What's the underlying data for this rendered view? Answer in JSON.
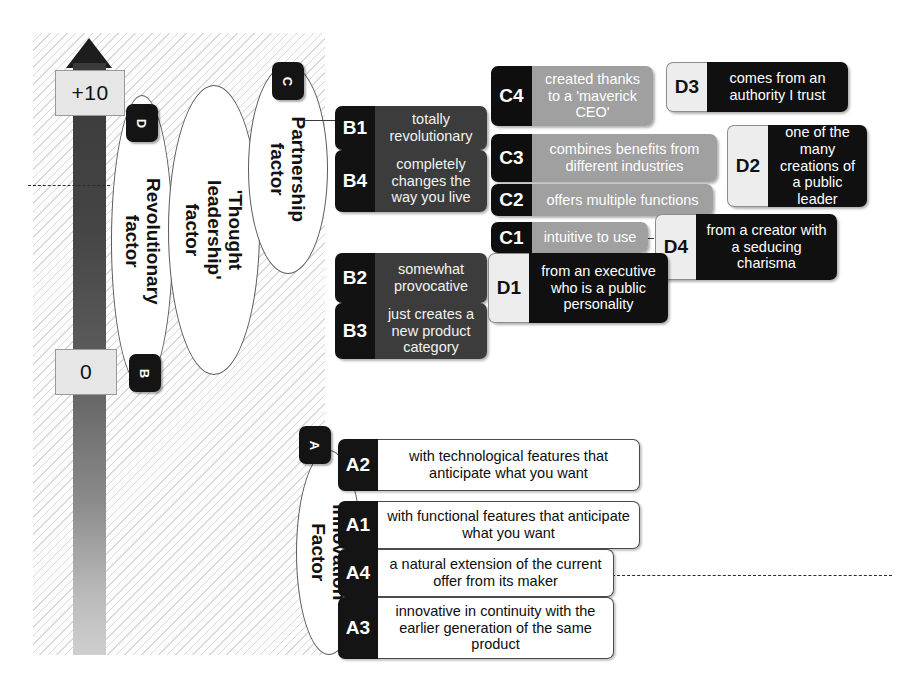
{
  "diagram": {
    "scale": {
      "top_label": "+10",
      "bottom_label": "0",
      "arrow": "up-arrow"
    },
    "ellipses": [
      {
        "id": "revolutionary",
        "label": "Revolutionary\nfactor",
        "line1": "Revolutionary",
        "line2": "factor"
      },
      {
        "id": "thought-leadership",
        "label": "'Thought leadership' factor",
        "line1": "'Thought",
        "line2": "leadership'",
        "line3": "factor"
      },
      {
        "id": "partnership",
        "label": "Partnership factor",
        "line1": "Partnership",
        "line2": "factor"
      },
      {
        "id": "innovation",
        "label": "Innovation Factor",
        "line1": "Innovation",
        "line2": "Factor"
      }
    ],
    "badges": [
      {
        "id": "badge-d",
        "letter": "D"
      },
      {
        "id": "badge-b",
        "letter": "B"
      },
      {
        "id": "badge-c",
        "letter": "C"
      },
      {
        "id": "badge-a",
        "letter": "A"
      }
    ],
    "items": {
      "b1": {
        "code": "B1",
        "text": "totally revolutionary"
      },
      "b4": {
        "code": "B4",
        "text": "completely changes the way you live"
      },
      "b2": {
        "code": "B2",
        "text": "somewhat provocative"
      },
      "b3": {
        "code": "B3",
        "text": "just creates a new product category"
      },
      "c4": {
        "code": "C4",
        "text": "created thanks to a 'maverick CEO'"
      },
      "c3": {
        "code": "C3",
        "text": "combines benefits from different industries"
      },
      "c2": {
        "code": "C2",
        "text": "offers multiple functions"
      },
      "c1": {
        "code": "C1",
        "text": "intuitive to use"
      },
      "d3": {
        "code": "D3",
        "text": "comes from an authority I trust"
      },
      "d2": {
        "code": "D2",
        "text": "one of the many creations of a public leader"
      },
      "d4": {
        "code": "D4",
        "text": "from a creator with a seducing charisma"
      },
      "d1": {
        "code": "D1",
        "text": "from an executive who is a public personality"
      },
      "a2": {
        "code": "A2",
        "text": "with technological features that anticipate what you want"
      },
      "a1": {
        "code": "A1",
        "text": "with functional features that anticipate what you want"
      },
      "a4": {
        "code": "A4",
        "text": "a natural extension of the current offer from its maker"
      },
      "a3": {
        "code": "A3",
        "text": "innovative in continuity with the earlier generation of the same product"
      }
    },
    "colors": {
      "bar_top": "#3a3a3a",
      "bar_bottom": "#cfcfcf",
      "label_black": "#121212",
      "body_dark_grey": "#3c3c3c",
      "body_mid_grey": "#a0a0a0",
      "body_black": "#101010",
      "panel_hatch": "#d9d9d9"
    }
  }
}
